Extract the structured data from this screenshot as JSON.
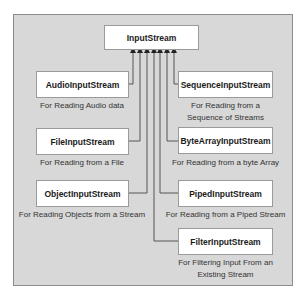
{
  "diagram": {
    "root": {
      "name": "InputStream"
    },
    "children": [
      {
        "name": "AudioInputStream",
        "description": "For Reading Audio data"
      },
      {
        "name": "FileInputStream",
        "description": "For Reading from a File"
      },
      {
        "name": "ObjectInputStream",
        "description": "For Reading Objects from a Stream"
      },
      {
        "name": "SequenceInputStream",
        "description_lines": [
          "For Reading from a",
          "Sequence of Streams"
        ]
      },
      {
        "name": "ByteArrayInputStream",
        "description": "For Reading from a byte Array"
      },
      {
        "name": "PipedInputStream",
        "description": "For Reading from a Piped Stream"
      },
      {
        "name": "FilterInputStream",
        "description_lines": [
          "For Filtering Input From an",
          "Existing Stream"
        ]
      }
    ],
    "colors": {
      "panel_bg": "#d8d8d8",
      "panel_border": "#8c8c8c",
      "box_bg": "#ffffff",
      "connector": "#555555"
    }
  }
}
